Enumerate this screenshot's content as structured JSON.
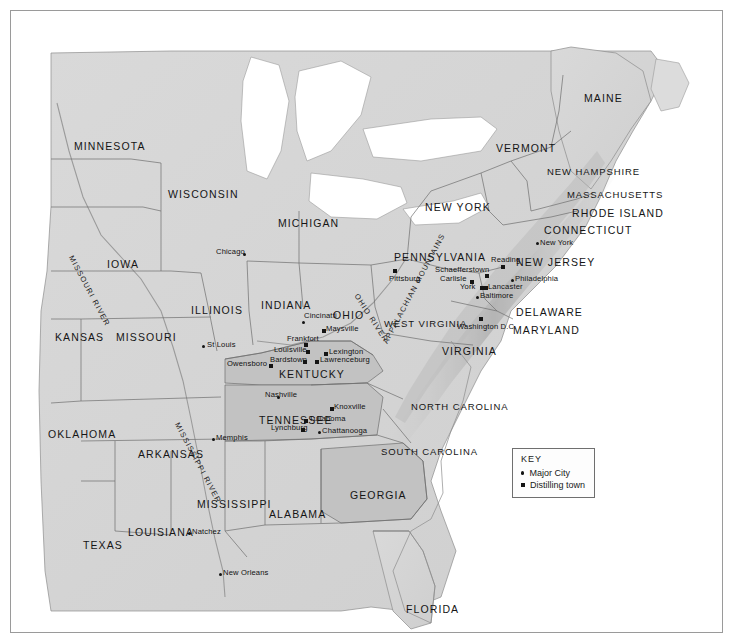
{
  "map": {
    "title": "Eastern United States whiskey distilling map",
    "colors": {
      "ocean": "#ffffff",
      "land_light": "#dcdcdc",
      "land_shaded": "#c2c2c2",
      "lake": "#ffffff",
      "border_line": "#6f6f6f",
      "coast_line": "#8a8a8a",
      "marker": "#141414",
      "text": "#1a1a1a"
    },
    "frame": {
      "x": 10,
      "y": 10,
      "width": 711,
      "height": 621
    }
  },
  "states": [
    {
      "name": "MINNESOTA",
      "x": 63,
      "y": 129,
      "shaded": false
    },
    {
      "name": "WISCONSIN",
      "x": 157,
      "y": 177,
      "shaded": false
    },
    {
      "name": "MICHIGAN",
      "x": 267,
      "y": 206,
      "shaded": false
    },
    {
      "name": "IOWA",
      "x": 96,
      "y": 247,
      "shaded": false
    },
    {
      "name": "ILLINOIS",
      "x": 180,
      "y": 293,
      "shaded": false
    },
    {
      "name": "INDIANA",
      "x": 250,
      "y": 288,
      "shaded": false
    },
    {
      "name": "OHIO",
      "x": 322,
      "y": 298,
      "shaded": false
    },
    {
      "name": "KANSAS",
      "x": 44,
      "y": 320,
      "shaded": false
    },
    {
      "name": "MISSOURI",
      "x": 105,
      "y": 320,
      "shaded": false
    },
    {
      "name": "KENTUCKY",
      "x": 268,
      "y": 357,
      "shaded": true
    },
    {
      "name": "WEST VIRGINIA",
      "x": 373,
      "y": 307,
      "shaded": false
    },
    {
      "name": "VIRGINIA",
      "x": 431,
      "y": 334,
      "shaded": false
    },
    {
      "name": "PENNSYLVANIA",
      "x": 383,
      "y": 240,
      "shaded": false
    },
    {
      "name": "NEW YORK",
      "x": 414,
      "y": 190,
      "shaded": false
    },
    {
      "name": "MAINE",
      "x": 573,
      "y": 81,
      "shaded": false
    },
    {
      "name": "VERMONT",
      "x": 485,
      "y": 131,
      "shaded": false
    },
    {
      "name": "NEW HAMPSHIRE",
      "x": 536,
      "y": 155,
      "shaded": false
    },
    {
      "name": "MASSACHUSETTS",
      "x": 556,
      "y": 178,
      "shaded": false
    },
    {
      "name": "RHODE ISLAND",
      "x": 561,
      "y": 196,
      "shaded": false
    },
    {
      "name": "CONNECTICUT",
      "x": 533,
      "y": 213,
      "shaded": false
    },
    {
      "name": "NEW JERSEY",
      "x": 505,
      "y": 245,
      "shaded": false
    },
    {
      "name": "DELAWARE",
      "x": 505,
      "y": 295,
      "shaded": false
    },
    {
      "name": "MARYLAND",
      "x": 502,
      "y": 313,
      "shaded": false
    },
    {
      "name": "NORTH CAROLINA",
      "x": 400,
      "y": 390,
      "shaded": false
    },
    {
      "name": "SOUTH CAROLINA",
      "x": 370,
      "y": 435,
      "shaded": false
    },
    {
      "name": "TENNESSEE",
      "x": 248,
      "y": 403,
      "shaded": true
    },
    {
      "name": "OKLAHOMA",
      "x": 37,
      "y": 417,
      "shaded": false
    },
    {
      "name": "ARKANSAS",
      "x": 127,
      "y": 437,
      "shaded": false
    },
    {
      "name": "MISSISSIPPI",
      "x": 186,
      "y": 487,
      "shaded": false
    },
    {
      "name": "ALABAMA",
      "x": 258,
      "y": 497,
      "shaded": false
    },
    {
      "name": "GEORGIA",
      "x": 339,
      "y": 478,
      "shaded": true
    },
    {
      "name": "LOUISIANA",
      "x": 117,
      "y": 515,
      "shaded": false
    },
    {
      "name": "TEXAS",
      "x": 72,
      "y": 528,
      "shaded": false
    },
    {
      "name": "FLORIDA",
      "x": 395,
      "y": 592,
      "shaded": false
    }
  ],
  "rivers": [
    {
      "name": "MISSOURI RIVER",
      "x": 64,
      "y": 243,
      "rotate": 62
    },
    {
      "name": "MISSISSIPPI RIVER",
      "x": 170,
      "y": 410,
      "rotate": 62
    },
    {
      "name": "OHIO RIVER",
      "x": 349,
      "y": 281,
      "rotate": 57
    }
  ],
  "ranges": [
    {
      "name": "APPALACHIAN MOUNTAINS",
      "x": 370,
      "y": 330,
      "rotate": -62
    }
  ],
  "cities": [
    {
      "name": "Chicago",
      "type": "major",
      "x": 232,
      "y": 242,
      "lx": 205,
      "ly": 236
    },
    {
      "name": "St Louis",
      "type": "major",
      "x": 191,
      "y": 334,
      "lx": 196,
      "ly": 329
    },
    {
      "name": "Cincinatti",
      "type": "major",
      "x": 291,
      "y": 310,
      "lx": 293,
      "ly": 300
    },
    {
      "name": "Maysville",
      "type": "distilling",
      "x": 311,
      "y": 318,
      "lx": 315,
      "ly": 313
    },
    {
      "name": "Frankfort",
      "type": "distilling",
      "x": 293,
      "y": 332,
      "lx": 276,
      "ly": 323
    },
    {
      "name": "Louisville",
      "type": "distilling",
      "x": 295,
      "y": 339,
      "lx": 263,
      "ly": 334
    },
    {
      "name": "Lexington",
      "type": "distilling",
      "x": 313,
      "y": 341,
      "lx": 318,
      "ly": 336
    },
    {
      "name": "Bardstown",
      "type": "distilling",
      "x": 292,
      "y": 349,
      "lx": 259,
      "ly": 344
    },
    {
      "name": "Lawrenceburg",
      "type": "distilling",
      "x": 304,
      "y": 349,
      "lx": 309,
      "ly": 344
    },
    {
      "name": "Owensboro",
      "type": "distilling",
      "x": 258,
      "y": 353,
      "lx": 216,
      "ly": 348
    },
    {
      "name": "Nashville",
      "type": "major",
      "x": 266,
      "y": 385,
      "lx": 254,
      "ly": 379
    },
    {
      "name": "Knoxville",
      "type": "distilling",
      "x": 319,
      "y": 396,
      "lx": 323,
      "ly": 391
    },
    {
      "name": "Tullahoma",
      "type": "distilling",
      "x": 293,
      "y": 408,
      "lx": 298,
      "ly": 403
    },
    {
      "name": "Lynchburg",
      "type": "distilling",
      "x": 290,
      "y": 417,
      "lx": 260,
      "ly": 412
    },
    {
      "name": "Chattanooga",
      "type": "major",
      "x": 307,
      "y": 420,
      "lx": 311,
      "ly": 415
    },
    {
      "name": "Memphis",
      "type": "major",
      "x": 201,
      "y": 427,
      "lx": 205,
      "ly": 422
    },
    {
      "name": "Natchez",
      "type": "major",
      "x": 177,
      "y": 521,
      "lx": 181,
      "ly": 516
    },
    {
      "name": "New Orleans",
      "type": "major",
      "x": 208,
      "y": 562,
      "lx": 212,
      "ly": 557
    },
    {
      "name": "Pittsburg",
      "type": "distilling",
      "x": 382,
      "y": 258,
      "lx": 378,
      "ly": 263
    },
    {
      "name": "Schaefferstown",
      "type": "distilling",
      "x": 474,
      "y": 263,
      "lx": 424,
      "ly": 254
    },
    {
      "name": "Carlisle",
      "type": "distilling",
      "x": 459,
      "y": 269,
      "lx": 429,
      "ly": 263
    },
    {
      "name": "York",
      "type": "distilling",
      "x": 469,
      "y": 275,
      "lx": 449,
      "ly": 271
    },
    {
      "name": "Lancaster",
      "type": "distilling",
      "x": 473,
      "y": 275,
      "lx": 477,
      "ly": 271
    },
    {
      "name": "Reading",
      "type": "distilling",
      "x": 490,
      "y": 254,
      "lx": 480,
      "ly": 244
    },
    {
      "name": "Philadelphia",
      "type": "major",
      "x": 500,
      "y": 268,
      "lx": 504,
      "ly": 263
    },
    {
      "name": "Baltimore",
      "type": "major",
      "x": 465,
      "y": 285,
      "lx": 469,
      "ly": 280
    },
    {
      "name": "Washington D.C.",
      "type": "distilling",
      "x": 468,
      "y": 306,
      "lx": 446,
      "ly": 311
    },
    {
      "name": "New York",
      "type": "major",
      "x": 525,
      "y": 231,
      "lx": 529,
      "ly": 227
    }
  ],
  "legend": {
    "title": "KEY",
    "x": 501,
    "y": 437,
    "items": [
      {
        "symbol": "circle",
        "label": "Major City"
      },
      {
        "symbol": "square",
        "label": "Distilling town"
      }
    ]
  }
}
